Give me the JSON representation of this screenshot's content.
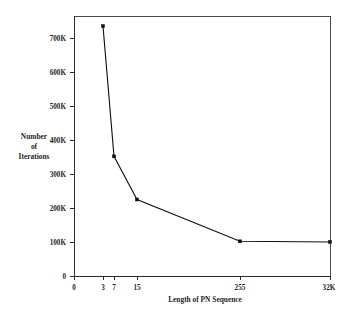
{
  "chart_data": {
    "type": "line",
    "title": "",
    "xlabel": "Length of PN Sequence",
    "ylabel": "Number of Iterations",
    "ylabel_lines": [
      "Number",
      "of",
      "Iterations"
    ],
    "x_categories": [
      "0",
      "3",
      "7",
      "15",
      "255",
      "32K"
    ],
    "x_tick_positions_px": [
      74,
      103,
      114,
      137,
      240,
      330
    ],
    "y_ticks": [
      "0",
      "100K",
      "200K",
      "300K",
      "400K",
      "500K",
      "600K",
      "700K"
    ],
    "y_tick_values": [
      0,
      100000,
      200000,
      300000,
      400000,
      500000,
      600000,
      700000
    ],
    "ylim": [
      0,
      765000
    ],
    "grid": false,
    "legend": null,
    "series": [
      {
        "name": "Number of Iterations",
        "x_labels": [
          "3",
          "7",
          "15",
          "255",
          "32K"
        ],
        "x_px": [
          103,
          114,
          137,
          240,
          330
        ],
        "values": [
          735000,
          352000,
          225000,
          102000,
          100000
        ],
        "marker": "square",
        "color": "#0d0d0d"
      }
    ],
    "frame": {
      "left_px": 74,
      "right_px": 330,
      "top_px": 16,
      "bottom_px": 276
    },
    "y_axis_pixel_map": {
      "value_0_px": 276,
      "value_100k_px": 242,
      "px_per_100k": 34
    }
  },
  "colors": {
    "background": "#ffffff",
    "frame": "#4a4a4a",
    "axis": "#2b2b2b",
    "series": "#0d0d0d",
    "text": "#1f1f1f"
  }
}
